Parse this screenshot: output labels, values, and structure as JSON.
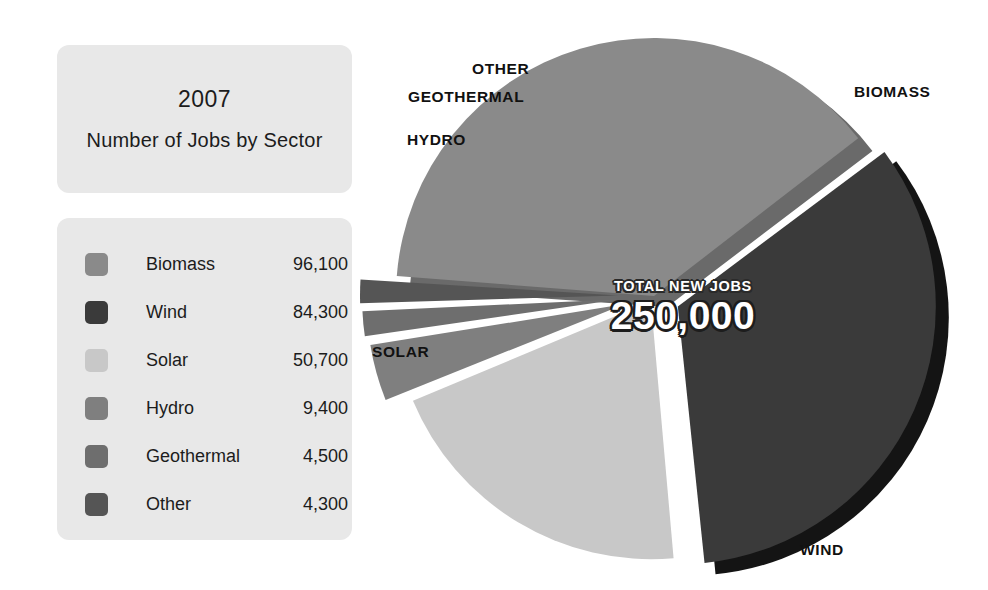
{
  "header": {
    "year": "2007",
    "subtitle": "Number of Jobs by Sector"
  },
  "legend": {
    "items": [
      {
        "label": "Biomass",
        "value": "96,100",
        "color": "#8a8a8a"
      },
      {
        "label": "Wind",
        "value": "84,300",
        "color": "#3a3a3a"
      },
      {
        "label": "Solar",
        "value": "50,700",
        "color": "#c8c8c8"
      },
      {
        "label": "Hydro",
        "value": "9,400",
        "color": "#7f7f7f"
      },
      {
        "label": "Geothermal",
        "value": "4,500",
        "color": "#6e6e6e"
      },
      {
        "label": "Other",
        "value": "4,300",
        "color": "#555555"
      }
    ]
  },
  "callout": {
    "caption": "TOTAL NEW JOBS",
    "total": "250,000"
  },
  "pie_labels": {
    "biomass": "BIOMASS",
    "wind": "WIND",
    "solar": "SOLAR",
    "hydro": "HYDRO",
    "geothermal": "GEOTHERMAL",
    "other": "OTHER"
  },
  "chart_data": {
    "type": "pie",
    "title": "2007 Number of Jobs by Sector",
    "subtitle": "Total New Jobs 250,000",
    "unit": "jobs",
    "total": 250000,
    "categories": [
      "Biomass",
      "Wind",
      "Solar",
      "Hydro",
      "Geothermal",
      "Other"
    ],
    "values": [
      96100,
      84300,
      50700,
      9400,
      4500,
      4300
    ],
    "percentages": [
      38.4,
      33.7,
      20.3,
      3.8,
      1.8,
      1.7
    ],
    "colors": [
      "#8a8a8a",
      "#3a3a3a",
      "#c8c8c8",
      "#7f7f7f",
      "#6e6e6e",
      "#555555"
    ],
    "exploded": [
      "Wind",
      "Hydro",
      "Geothermal",
      "Other"
    ],
    "legend": "left",
    "grid": false,
    "xlabel": "",
    "ylabel": ""
  }
}
